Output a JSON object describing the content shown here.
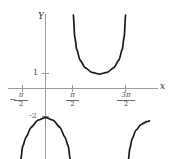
{
  "figure": {
    "title": "",
    "axis_labels": {
      "x": "x",
      "y": "Y"
    },
    "colors": {
      "axis": "#9a9a9a",
      "curve": "#1a1a1a",
      "text": "#3a3a3a",
      "background": "#ffffff"
    }
  },
  "ticks": {
    "x": [
      {
        "label_num": "π",
        "label_den": "2",
        "sign": "−",
        "text": "-π/2",
        "value": -1.5708,
        "px": 22
      },
      {
        "label_num": "π",
        "label_den": "2",
        "sign": "",
        "text": "π/2",
        "value": 1.5708,
        "px": 72
      },
      {
        "label_num": "3π",
        "label_den": "2",
        "sign": "",
        "text": "3π/2",
        "value": 4.7124,
        "px": 125
      }
    ],
    "y": [
      {
        "text": "1",
        "value": 1,
        "px": 73
      },
      {
        "text": "-2",
        "value": -2,
        "px": 116
      }
    ]
  },
  "chart_data": {
    "type": "line",
    "title": "",
    "xlabel": "x",
    "ylabel": "Y",
    "xlim": [
      -2.4,
      6.1
    ],
    "ylim": [
      -6.0,
      5.2
    ],
    "grid": false,
    "legend": null,
    "asymptotes": [
      -1.5708,
      1.5708,
      4.7124
    ],
    "series": [
      {
        "name": "branch-upper-middle",
        "shape": "U",
        "x_range": [
          1.5708,
          4.7124
        ],
        "vertex": {
          "x": 3.1416,
          "y": 1
        },
        "points": [
          [
            1.62,
            5.1
          ],
          [
            1.7,
            3.6
          ],
          [
            1.82,
            2.7
          ],
          [
            2.0,
            2.0
          ],
          [
            2.3,
            1.45
          ],
          [
            2.7,
            1.12
          ],
          [
            3.14,
            1.0
          ],
          [
            3.58,
            1.12
          ],
          [
            3.98,
            1.45
          ],
          [
            4.28,
            2.0
          ],
          [
            4.46,
            2.7
          ],
          [
            4.58,
            3.6
          ],
          [
            4.66,
            5.1
          ]
        ]
      },
      {
        "name": "branch-lower-left",
        "shape": "inverted-U",
        "x_range": [
          -1.5708,
          1.5708
        ],
        "vertex": {
          "x": 0,
          "y": -2
        },
        "points": [
          [
            -1.52,
            -6.0
          ],
          [
            -1.44,
            -4.9
          ],
          [
            -1.32,
            -4.0
          ],
          [
            -1.14,
            -3.4
          ],
          [
            -0.84,
            -2.7
          ],
          [
            -0.44,
            -2.2
          ],
          [
            0.0,
            -2.0
          ],
          [
            0.44,
            -2.2
          ],
          [
            0.84,
            -2.7
          ],
          [
            1.14,
            -3.4
          ],
          [
            1.32,
            -4.0
          ],
          [
            1.44,
            -4.9
          ],
          [
            1.52,
            -6.0
          ]
        ]
      },
      {
        "name": "branch-lower-right",
        "shape": "partial-rising",
        "x_range": [
          4.7124,
          6.05
        ],
        "points": [
          [
            4.78,
            -6.0
          ],
          [
            4.82,
            -5.0
          ],
          [
            4.9,
            -4.2
          ],
          [
            5.04,
            -3.5
          ],
          [
            5.26,
            -2.9
          ],
          [
            5.56,
            -2.5
          ],
          [
            5.9,
            -2.3
          ],
          [
            6.05,
            -2.25
          ]
        ]
      }
    ]
  }
}
